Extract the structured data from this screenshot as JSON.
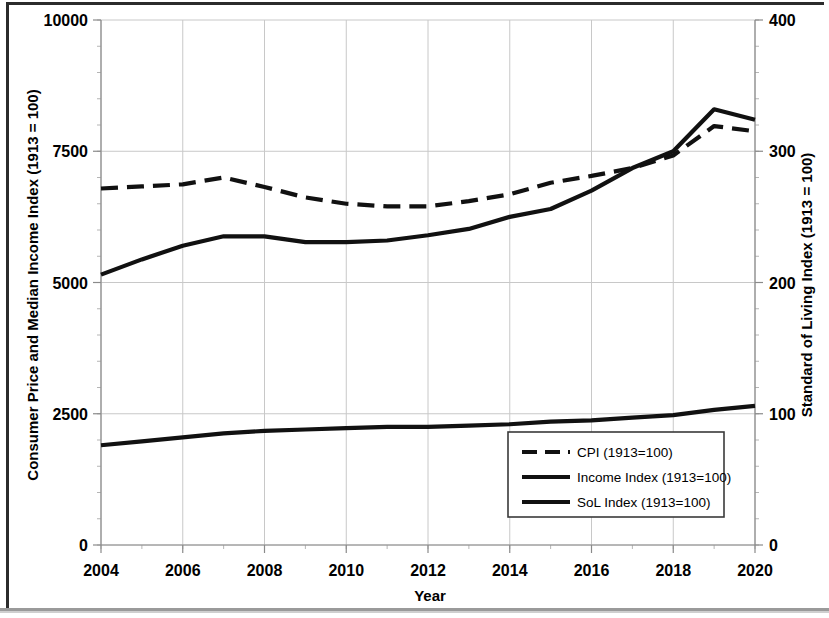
{
  "chart_data": {
    "type": "line",
    "title": "",
    "xlabel": "Year",
    "ylabel": "Consumer Price and Median Income Index (1913 = 100)",
    "y2label": "Standard of Living Index (1913 = 100)",
    "x": [
      2004,
      2005,
      2006,
      2007,
      2008,
      2009,
      2010,
      2011,
      2012,
      2013,
      2014,
      2015,
      2016,
      2017,
      2018,
      2019,
      2020
    ],
    "xlim": [
      2004,
      2020
    ],
    "ylim": [
      0,
      10000
    ],
    "y2lim": [
      0,
      400
    ],
    "xticks": [
      2004,
      2006,
      2008,
      2010,
      2012,
      2014,
      2016,
      2018,
      2020
    ],
    "xtick_labels": [
      "2004",
      "2006",
      "2008",
      "2010",
      "2012",
      "2014",
      "2016",
      "2018",
      "2020"
    ],
    "yticks": [
      0,
      2500,
      5000,
      7500,
      10000
    ],
    "ytick_labels": [
      "0",
      "2500",
      "5000",
      "7500",
      "10000"
    ],
    "y2ticks": [
      0,
      100,
      200,
      300,
      400
    ],
    "y2tick_labels": [
      "0",
      "100",
      "200",
      "300",
      "400"
    ],
    "grid": true,
    "legend_position": "lower right",
    "series": [
      {
        "name": "CPI (1913=100)",
        "axis": "left",
        "style": "dashed",
        "width": 4.2,
        "values": [
          6790,
          6830,
          6870,
          7000,
          6820,
          6620,
          6500,
          6450,
          6450,
          6550,
          6680,
          6900,
          7030,
          7180,
          7420,
          7980,
          7880
        ]
      },
      {
        "name": "Income Index (1913=100)",
        "axis": "left",
        "style": "solid",
        "width": 4.2,
        "values": [
          5150,
          5440,
          5700,
          5880,
          5880,
          5770,
          5770,
          5800,
          5900,
          6020,
          6250,
          6400,
          6750,
          7180,
          7500,
          8300,
          8100
        ]
      },
      {
        "name": "SoL Index (1913=100)",
        "axis": "right",
        "style": "solid",
        "width": 4.2,
        "values": [
          76,
          79,
          82,
          85,
          87,
          88,
          89,
          90,
          90,
          91,
          92,
          94,
          95,
          97,
          99,
          103,
          106
        ]
      }
    ]
  },
  "legend": {
    "items": [
      {
        "label": "CPI (1913=100)",
        "style": "dashed"
      },
      {
        "label": "Income Index (1913=100)",
        "style": "solid"
      },
      {
        "label": "SoL Index (1913=100)",
        "style": "solid"
      }
    ]
  },
  "colors": {
    "line": "#111111",
    "grid": "#c8c8c8",
    "axis": "#8a8a8a",
    "frame": "#2b2b2b",
    "background": "#ffffff"
  }
}
